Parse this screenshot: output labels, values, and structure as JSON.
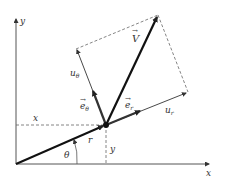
{
  "diagram": {
    "labels": {
      "x_axis": "x",
      "y_axis": "y",
      "velocity": "V",
      "e_theta": "e",
      "e_theta_sub": "θ",
      "e_r": "e",
      "e_r_sub": "r",
      "u_theta": "u",
      "u_theta_sub": "θ",
      "u_r": "u",
      "u_r_sub": "r",
      "x_coord": "x",
      "y_coord": "y",
      "radius": "r",
      "angle": "θ"
    },
    "colors": {
      "axis": "#555555",
      "vector": "#111111",
      "dashed": "#666666",
      "background": "#ffffff"
    }
  }
}
